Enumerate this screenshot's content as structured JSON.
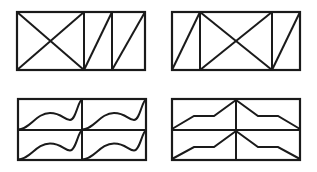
{
  "figure": {
    "title": "",
    "background_color": "#ffffff",
    "stroke_color": "#1a1a1a",
    "panel_count": 4,
    "layout": "2x2 grid of line-drawing panels"
  },
  "panels": [
    {
      "id": "panel-top-left",
      "name": "top-left-panel",
      "description": "Rectangle split by two vertical dividers into three cells; the wide left cell contains a full X (both diagonals), the two narrow right cells each contain a single diagonal rising left-to-right.",
      "frame": {
        "x": 17,
        "y": 12,
        "width": 128,
        "height": 58
      },
      "dividers_x": [
        84,
        112
      ],
      "cells": [
        {
          "name": "cell-1",
          "motif": "X (two crossing diagonals)"
        },
        {
          "name": "cell-2",
          "motif": "single rising diagonal"
        },
        {
          "name": "cell-3",
          "motif": "single rising diagonal"
        }
      ]
    },
    {
      "id": "panel-top-right",
      "name": "top-right-panel",
      "description": "Rectangle split by two vertical dividers into three cells; narrow left cell has a single rising diagonal, wide middle cell has a full X, narrow right cell has a single rising diagonal.",
      "frame": {
        "x": 172,
        "y": 12,
        "width": 128,
        "height": 58
      },
      "dividers_x": [
        200,
        272
      ],
      "cells": [
        {
          "name": "cell-1",
          "motif": "single rising diagonal"
        },
        {
          "name": "cell-2",
          "motif": "X (two crossing diagonals)"
        },
        {
          "name": "cell-3",
          "motif": "single rising diagonal"
        }
      ]
    },
    {
      "id": "panel-bottom-left",
      "name": "bottom-left-panel",
      "description": "Rectangle split into a 2x2 grid; every cell contains an S-shaped wavy curve running from the bottom-left corner to the top-right corner.",
      "frame": {
        "x": 18,
        "y": 99,
        "width": 128,
        "height": 61
      },
      "dividers_x": [
        82
      ],
      "dividers_y": [
        131
      ],
      "cells": [
        {
          "name": "cell-top-left",
          "motif": "S-curve bottom-left to top-right"
        },
        {
          "name": "cell-top-right",
          "motif": "S-curve bottom-left to top-right"
        },
        {
          "name": "cell-bottom-left",
          "motif": "S-curve bottom-left to top-right"
        },
        {
          "name": "cell-bottom-right",
          "motif": "S-curve bottom-left to top-right"
        }
      ]
    },
    {
      "id": "panel-bottom-right",
      "name": "bottom-right-panel",
      "description": "Rectangle split into a 2x2 grid; left cells contain a rising stepped zigzag (ramp, plateau, ramp) from bottom-left to top-right, right cells contain the mirrored falling stepped zigzag from top-left to bottom-right.",
      "frame": {
        "x": 172,
        "y": 99,
        "width": 128,
        "height": 61
      },
      "dividers_x": [
        236
      ],
      "dividers_y": [
        130
      ],
      "cells": [
        {
          "name": "cell-top-left",
          "motif": "rising stepped zigzag"
        },
        {
          "name": "cell-top-right",
          "motif": "falling stepped zigzag"
        },
        {
          "name": "cell-bottom-left",
          "motif": "rising stepped zigzag"
        },
        {
          "name": "cell-bottom-right",
          "motif": "falling stepped zigzag"
        }
      ]
    }
  ]
}
